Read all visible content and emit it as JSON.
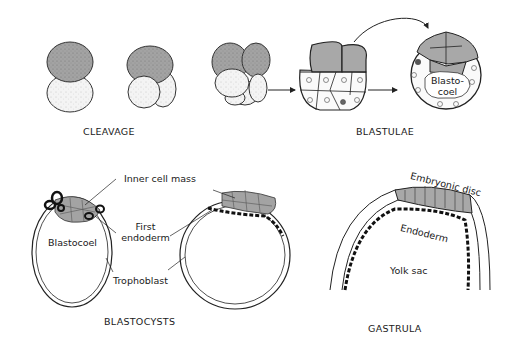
{
  "figure": {
    "top_row": {
      "caption_left": "CLEAVAGE",
      "caption_right": "BLASTULAE",
      "blastocoel_label_line1": "Blasto-",
      "blastocoel_label_line2": "coel"
    },
    "bottom_left": {
      "caption": "BLASTOCYSTS",
      "labels": {
        "inner_cell_mass": "Inner cell mass",
        "first_endoderm_line1": "First",
        "first_endoderm_line2": "endoderm",
        "blastocoel": "Blastocoel",
        "trophoblast": "Trophoblast"
      }
    },
    "bottom_right": {
      "caption": "GASTRULA",
      "labels": {
        "embryonic_disc": "Embryonic disc",
        "endoderm": "Endoderm",
        "yolk_sac": "Yolk sac"
      }
    },
    "colors": {
      "dark_cell": "#9a9a9a",
      "light_cell": "#f2f2f2",
      "endoderm": "#111111",
      "outline": "#222222"
    }
  }
}
